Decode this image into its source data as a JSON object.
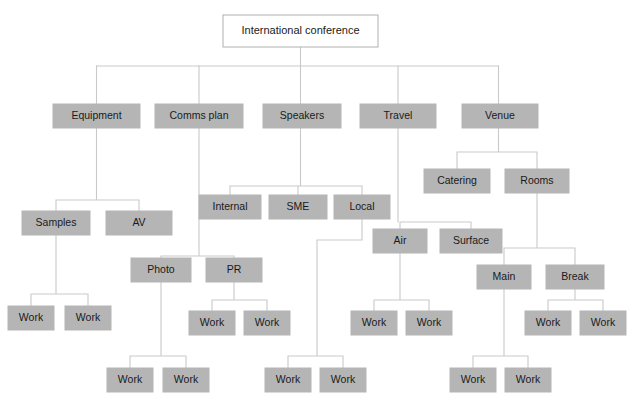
{
  "diagram": {
    "title": "International conference",
    "type": "work-breakdown-structure",
    "colors": {
      "background": "#ffffff",
      "root_fill": "#ffffff",
      "root_stroke": "#b0b0b0",
      "node_fill": "#b5b5b5",
      "node_stroke": "#b5b5b5",
      "connector": "#c9c9c9",
      "text": "#1a1a1a"
    },
    "labels": {
      "root": "International conference",
      "equipment": "Equipment",
      "comms_plan": "Comms plan",
      "speakers": "Speakers",
      "travel": "Travel",
      "venue": "Venue",
      "catering": "Catering",
      "rooms": "Rooms",
      "internal": "Internal",
      "sme": "SME",
      "local": "Local",
      "samples": "Samples",
      "av": "AV",
      "air": "Air",
      "surface": "Surface",
      "photo": "Photo",
      "pr": "PR",
      "main": "Main",
      "break": "Break",
      "work": "Work"
    },
    "nodes": [
      {
        "id": "root",
        "label": "International conference",
        "x": 223,
        "y": 15,
        "w": 155,
        "h": 32,
        "style": "root"
      },
      {
        "id": "equipment",
        "label": "Equipment",
        "x": 53,
        "y": 104,
        "w": 87,
        "h": 24,
        "style": "fill"
      },
      {
        "id": "comms",
        "label": "Comms plan",
        "x": 155,
        "y": 104,
        "w": 88,
        "h": 24,
        "style": "fill"
      },
      {
        "id": "speakers",
        "label": "Speakers",
        "x": 263,
        "y": 104,
        "w": 78,
        "h": 24,
        "style": "fill"
      },
      {
        "id": "travel",
        "label": "Travel",
        "x": 360,
        "y": 104,
        "w": 76,
        "h": 24,
        "style": "fill"
      },
      {
        "id": "venue",
        "label": "Venue",
        "x": 462,
        "y": 104,
        "w": 76,
        "h": 24,
        "style": "fill"
      },
      {
        "id": "catering",
        "label": "Catering",
        "x": 424,
        "y": 169,
        "w": 66,
        "h": 24,
        "style": "fill"
      },
      {
        "id": "rooms",
        "label": "Rooms",
        "x": 505,
        "y": 169,
        "w": 64,
        "h": 24,
        "style": "fill"
      },
      {
        "id": "internal",
        "label": "Internal",
        "x": 199,
        "y": 195,
        "w": 62,
        "h": 24,
        "style": "fill"
      },
      {
        "id": "sme",
        "label": "SME",
        "x": 269,
        "y": 195,
        "w": 58,
        "h": 24,
        "style": "fill"
      },
      {
        "id": "local",
        "label": "Local",
        "x": 334,
        "y": 195,
        "w": 56,
        "h": 24,
        "style": "fill"
      },
      {
        "id": "samples",
        "label": "Samples",
        "x": 22,
        "y": 211,
        "w": 68,
        "h": 24,
        "style": "fill"
      },
      {
        "id": "av",
        "label": "AV",
        "x": 106,
        "y": 211,
        "w": 66,
        "h": 24,
        "style": "fill"
      },
      {
        "id": "air",
        "label": "Air",
        "x": 373,
        "y": 229,
        "w": 54,
        "h": 24,
        "style": "fill"
      },
      {
        "id": "surface",
        "label": "Surface",
        "x": 440,
        "y": 229,
        "w": 62,
        "h": 24,
        "style": "fill"
      },
      {
        "id": "photo",
        "label": "Photo",
        "x": 131,
        "y": 258,
        "w": 60,
        "h": 24,
        "style": "fill"
      },
      {
        "id": "pr",
        "label": "PR",
        "x": 206,
        "y": 258,
        "w": 56,
        "h": 24,
        "style": "fill"
      },
      {
        "id": "main",
        "label": "Main",
        "x": 477,
        "y": 265,
        "w": 54,
        "h": 24,
        "style": "fill"
      },
      {
        "id": "break",
        "label": "Break",
        "x": 546,
        "y": 265,
        "w": 58,
        "h": 24,
        "style": "fill"
      },
      {
        "id": "w1",
        "label": "Work",
        "x": 8,
        "y": 306,
        "w": 46,
        "h": 24,
        "style": "fill"
      },
      {
        "id": "w2",
        "label": "Work",
        "x": 65,
        "y": 306,
        "w": 46,
        "h": 24,
        "style": "fill"
      },
      {
        "id": "w3",
        "label": "Work",
        "x": 189,
        "y": 311,
        "w": 46,
        "h": 24,
        "style": "fill"
      },
      {
        "id": "w4",
        "label": "Work",
        "x": 244,
        "y": 311,
        "w": 46,
        "h": 24,
        "style": "fill"
      },
      {
        "id": "w5",
        "label": "Work",
        "x": 351,
        "y": 311,
        "w": 46,
        "h": 24,
        "style": "fill"
      },
      {
        "id": "w6",
        "label": "Work",
        "x": 406,
        "y": 311,
        "w": 46,
        "h": 24,
        "style": "fill"
      },
      {
        "id": "w7",
        "label": "Work",
        "x": 525,
        "y": 311,
        "w": 46,
        "h": 24,
        "style": "fill"
      },
      {
        "id": "w8",
        "label": "Work",
        "x": 580,
        "y": 311,
        "w": 46,
        "h": 24,
        "style": "fill"
      },
      {
        "id": "w9",
        "label": "Work",
        "x": 107,
        "y": 368,
        "w": 46,
        "h": 24,
        "style": "fill"
      },
      {
        "id": "w10",
        "label": "Work",
        "x": 163,
        "y": 368,
        "w": 46,
        "h": 24,
        "style": "fill"
      },
      {
        "id": "w11",
        "label": "Work",
        "x": 265,
        "y": 368,
        "w": 46,
        "h": 24,
        "style": "fill"
      },
      {
        "id": "w12",
        "label": "Work",
        "x": 320,
        "y": 368,
        "w": 46,
        "h": 24,
        "style": "fill"
      },
      {
        "id": "w13",
        "label": "Work",
        "x": 450,
        "y": 368,
        "w": 46,
        "h": 24,
        "style": "fill"
      },
      {
        "id": "w14",
        "label": "Work",
        "x": 505,
        "y": 368,
        "w": 46,
        "h": 24,
        "style": "fill"
      }
    ],
    "connectors": [
      "M300.5,47 L300.5,66",
      "M96.5,66 L498.5,66",
      "M96.5,66 L96.5,104",
      "M199,66 L199,104",
      "M300.5,66 L300.5,104",
      "M398,66 L398,104",
      "M498.5,66 L498.5,104",
      "M96.5,128 L96.5,200 M56,200 L139,200 M56,200 L56,211 M139,200 L139,211",
      "M56,235 L56,294 M31,294 L88,294 M31,294 L31,306 M88,294 L88,306",
      "M199,128 L199,256 M161,256 L234,256 M161,256 L161,258 M234,256 L234,258",
      "M234,282 L234,300 M212,300 L267,300 M212,300 L212,311 M267,300 L267,311",
      "M161,282 L161,356 M130,356 L186,356 M130,356 L130,368 M186,356 L186,368",
      "M300.5,128 L300.5,186 M230,186 L362,186 M230,186 L230,195 M298,186 L298,195 M362,186 L362,195",
      "M362,219 L362,240 M317,240 L362,240 M317,240 L317,356 M288,356 L343,356 M288,356 L288,368 M343,356 L343,368",
      "M398,128 L398,222 M400,222 L471,222 M400,222 L400,229 M471,222 L471,229",
      "M400,253 L400,300 M374,300 L429,300 M374,300 L374,311 M429,300 L429,311",
      "M498.5,128 L498.5,152 M457,152 L537,152 M457,152 L457,169 M537,152 L537,169",
      "M537,193 L537,248 M504,248 L575,248 M504,248 L504,265 M575,248 L575,265",
      "M504,289 L504,356 M473,356 L528,356 M473,356 L473,368 M528,356 L528,368",
      "M575,289 L575,300 M548,300 L603,300 M548,300 L548,311 M603,300 L603,311"
    ]
  }
}
